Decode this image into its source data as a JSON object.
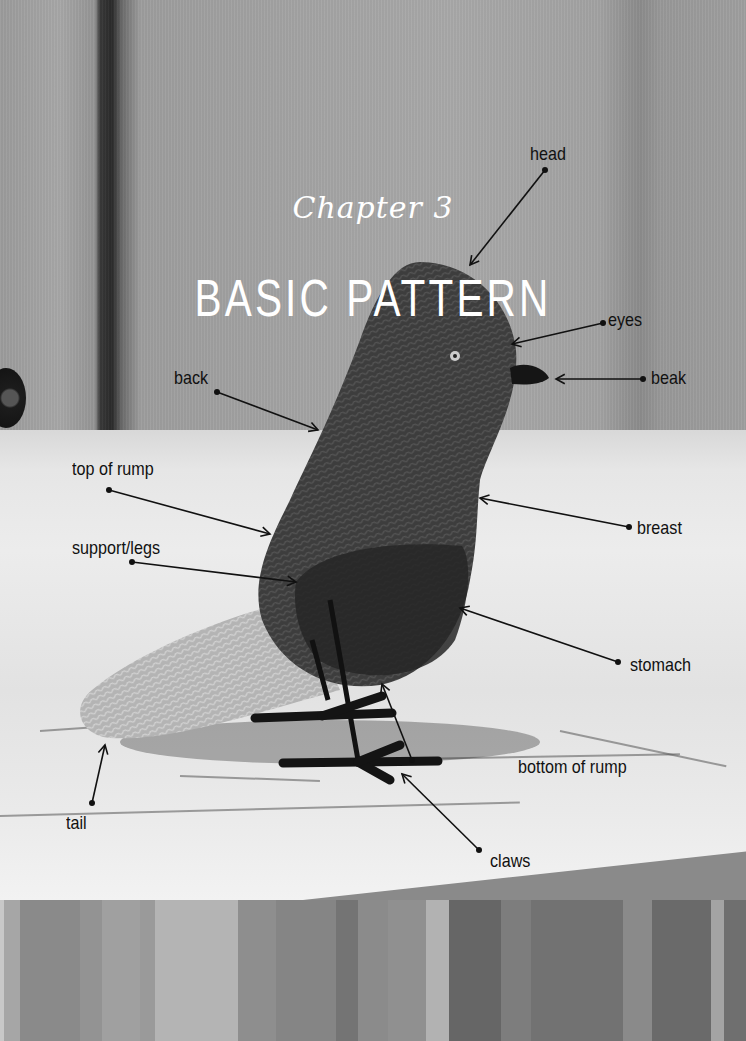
{
  "header": {
    "chapter": "Chapter 3",
    "title": "BASIC PATTERN"
  },
  "labels": [
    {
      "id": "head",
      "text": "head",
      "x": 530,
      "y": 143,
      "dot": [
        545,
        170
      ],
      "tip": [
        470,
        265
      ]
    },
    {
      "id": "eyes",
      "text": "eyes",
      "x": 608,
      "y": 309,
      "dot": [
        603,
        323
      ],
      "tip": [
        512,
        344
      ]
    },
    {
      "id": "beak",
      "text": "beak",
      "x": 651,
      "y": 367,
      "dot": [
        643,
        379
      ],
      "tip": [
        556,
        379
      ]
    },
    {
      "id": "back",
      "text": "back",
      "x": 174,
      "y": 367,
      "dot": [
        217,
        392
      ],
      "tip": [
        318,
        430
      ]
    },
    {
      "id": "top-of-rump",
      "text": "top of rump",
      "x": 72,
      "y": 458,
      "dot": [
        109,
        490
      ],
      "tip": [
        270,
        534
      ]
    },
    {
      "id": "breast",
      "text": "breast",
      "x": 637,
      "y": 517,
      "dot": [
        629,
        527
      ],
      "tip": [
        480,
        498
      ]
    },
    {
      "id": "support-legs",
      "text": "support/legs",
      "x": 72,
      "y": 537,
      "dot": [
        132,
        562
      ],
      "tip": [
        296,
        582
      ]
    },
    {
      "id": "stomach",
      "text": "stomach",
      "x": 630,
      "y": 654,
      "dot": [
        618,
        662
      ],
      "tip": [
        460,
        608
      ]
    },
    {
      "id": "bottom-of-rump",
      "text": "bottom of rump",
      "x": 518,
      "y": 756,
      "dot": [
        412,
        760
      ],
      "tip": [
        382,
        684
      ]
    },
    {
      "id": "tail",
      "text": "tail",
      "x": 66,
      "y": 812,
      "dot": [
        92,
        803
      ],
      "tip": [
        105,
        745
      ]
    },
    {
      "id": "claws",
      "text": "claws",
      "x": 490,
      "y": 850,
      "dot": [
        479,
        850
      ],
      "tip": [
        402,
        774
      ]
    }
  ],
  "colors": {
    "label_text": "#111111",
    "title_text": "#ffffff",
    "bird_body": "#3a3a3a",
    "bird_tail": "#b5b5b5",
    "feet": "#151515"
  },
  "stripes": [
    {
      "w": 4,
      "c": "#c8c8c8"
    },
    {
      "w": 16,
      "c": "#a6a6a6"
    },
    {
      "w": 60,
      "c": "#8a8a8a"
    },
    {
      "w": 23,
      "c": "#939393"
    },
    {
      "w": 38,
      "c": "#a0a0a0"
    },
    {
      "w": 15,
      "c": "#9a9a9a"
    },
    {
      "w": 83,
      "c": "#b4b4b4"
    },
    {
      "w": 38,
      "c": "#8e8e8e"
    },
    {
      "w": 61,
      "c": "#858585"
    },
    {
      "w": 22,
      "c": "#747474"
    },
    {
      "w": 30,
      "c": "#8b8b8b"
    },
    {
      "w": 38,
      "c": "#909090"
    },
    {
      "w": 23,
      "c": "#b2b2b2"
    },
    {
      "w": 53,
      "c": "#666666"
    },
    {
      "w": 30,
      "c": "#7d7d7d"
    },
    {
      "w": 92,
      "c": "#727272"
    },
    {
      "w": 29,
      "c": "#8a8a8a"
    },
    {
      "w": 60,
      "c": "#6a6a6a"
    },
    {
      "w": 13,
      "c": "#a4a4a4"
    },
    {
      "w": 22,
      "c": "#6f6f6f"
    }
  ]
}
